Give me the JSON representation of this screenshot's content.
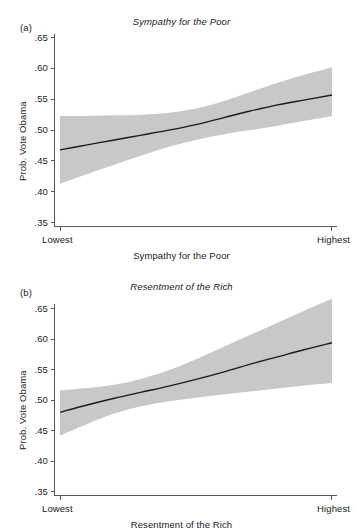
{
  "figure": {
    "panels": [
      {
        "letter": "(a)",
        "title": "Sympathy for the Poor",
        "xlabel": "Sympathy for the Poor",
        "ylabel": "Prob. Vote Obama",
        "xtick_left": "Lowest",
        "xtick_right": "Highest",
        "yticks": [
          ".65",
          ".60",
          ".55",
          ".50",
          ".45",
          ".40",
          ".35"
        ]
      },
      {
        "letter": "(b)",
        "title": "Resentment of the Rich",
        "xlabel": "Resentment of the Rich",
        "ylabel": "Prob. Vote Obama",
        "xtick_left": "Lowest",
        "xtick_right": "Highest",
        "yticks": [
          ".65",
          ".60",
          ".55",
          ".50",
          ".45",
          ".40",
          ".35"
        ]
      }
    ]
  },
  "chart_data": [
    {
      "type": "line",
      "title": "Sympathy for the Poor",
      "xlabel": "Sympathy for the Poor",
      "ylabel": "Prob. Vote Obama",
      "ylim": [
        0.35,
        0.65
      ],
      "xlim": [
        0,
        1
      ],
      "ytick_values": [
        0.65,
        0.6,
        0.55,
        0.5,
        0.45,
        0.4,
        0.35
      ],
      "ytick_labels": [
        ".65",
        ".60",
        ".55",
        ".50",
        ".45",
        ".40",
        ".35"
      ],
      "xtick_values": [
        0,
        1
      ],
      "xtick_labels": [
        "Lowest",
        "Highest"
      ],
      "grid": false,
      "legend": "none",
      "series": [
        {
          "name": "Predicted probability",
          "x": [
            0.0,
            0.1,
            0.2,
            0.3,
            0.4,
            0.5,
            0.6,
            0.7,
            0.8,
            0.9,
            1.0
          ],
          "values": [
            0.467,
            0.475,
            0.483,
            0.491,
            0.499,
            0.508,
            0.519,
            0.53,
            0.54,
            0.548,
            0.556
          ]
        },
        {
          "name": "95% confidence interval upper",
          "x": [
            0.0,
            0.1,
            0.2,
            0.3,
            0.4,
            0.5,
            0.6,
            0.7,
            0.8,
            0.9,
            1.0
          ],
          "values": [
            0.522,
            0.522,
            0.523,
            0.524,
            0.527,
            0.534,
            0.546,
            0.561,
            0.576,
            0.589,
            0.601
          ]
        },
        {
          "name": "95% confidence interval lower",
          "x": [
            0.0,
            0.1,
            0.2,
            0.3,
            0.4,
            0.5,
            0.6,
            0.7,
            0.8,
            0.9,
            1.0
          ],
          "values": [
            0.412,
            0.428,
            0.443,
            0.458,
            0.472,
            0.483,
            0.492,
            0.499,
            0.506,
            0.514,
            0.522
          ]
        }
      ]
    },
    {
      "type": "line",
      "title": "Resentment of the Rich",
      "xlabel": "Resentment of the Rich",
      "ylabel": "Prob. Vote Obama",
      "ylim": [
        0.35,
        0.65
      ],
      "xlim": [
        0,
        1
      ],
      "ytick_values": [
        0.65,
        0.6,
        0.55,
        0.5,
        0.45,
        0.4,
        0.35
      ],
      "ytick_labels": [
        ".65",
        ".60",
        ".55",
        ".50",
        ".45",
        ".40",
        ".35"
      ],
      "xtick_values": [
        0,
        1
      ],
      "xtick_labels": [
        "Lowest",
        "Highest"
      ],
      "grid": false,
      "legend": "none",
      "series": [
        {
          "name": "Predicted probability",
          "x": [
            0.0,
            0.1,
            0.2,
            0.3,
            0.4,
            0.5,
            0.6,
            0.7,
            0.8,
            0.9,
            1.0
          ],
          "values": [
            0.479,
            0.491,
            0.502,
            0.512,
            0.522,
            0.533,
            0.545,
            0.558,
            0.57,
            0.582,
            0.593
          ]
        },
        {
          "name": "95% confidence interval upper",
          "x": [
            0.0,
            0.1,
            0.2,
            0.3,
            0.4,
            0.5,
            0.6,
            0.7,
            0.8,
            0.9,
            1.0
          ],
          "values": [
            0.515,
            0.519,
            0.524,
            0.534,
            0.548,
            0.566,
            0.586,
            0.606,
            0.626,
            0.646,
            0.665
          ]
        },
        {
          "name": "95% confidence interval lower",
          "x": [
            0.0,
            0.1,
            0.2,
            0.3,
            0.4,
            0.5,
            0.6,
            0.7,
            0.8,
            0.9,
            1.0
          ],
          "values": [
            0.441,
            0.46,
            0.477,
            0.489,
            0.497,
            0.503,
            0.508,
            0.513,
            0.518,
            0.523,
            0.527
          ]
        }
      ]
    }
  ],
  "style": {
    "band_color": "#c8c8c8",
    "line_color": "#1a1a1a",
    "axis_color": "#595959",
    "background": "#ffffff"
  }
}
